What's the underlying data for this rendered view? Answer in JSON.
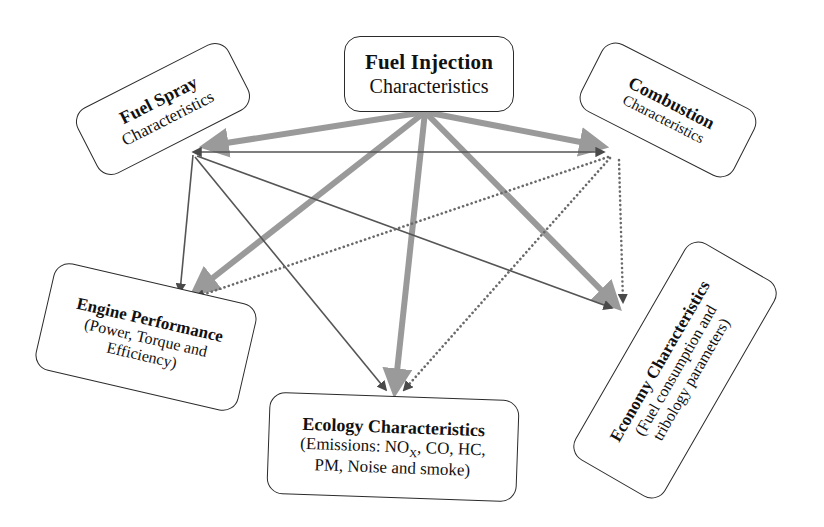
{
  "diagram": {
    "colors": {
      "thick_arrow": "#9a9a9a",
      "thin_arrow": "#555555",
      "dotted_arrow": "#6a6a6a",
      "node_border": "#2b2b2b",
      "background": "#ffffff"
    }
  },
  "nodes": {
    "injection": {
      "title": "Fuel Injection",
      "subtitle": "Characteristics"
    },
    "spray": {
      "title": "Fuel Spray",
      "subtitle": "Characteristics"
    },
    "combustion": {
      "title": "Combustion",
      "subtitle": "Characteristics"
    },
    "engine": {
      "title": "Engine Performance",
      "line2": "(Power, Torque and",
      "line3": "Efficiency)"
    },
    "ecology": {
      "title": "Ecology  Characteristics",
      "line2_pre": "(Emissions: NO",
      "line2_sub": "X",
      "line2_post": ", CO, HC,",
      "line3": "PM, Noise and smoke)"
    },
    "economy": {
      "title": "Economy  Characteristics",
      "line2": "(Fuel consumption and",
      "line3": "tribology parameters)"
    }
  },
  "edges": [
    {
      "id": "inj-spray",
      "from": "injection",
      "to": "spray",
      "style": "thick-gray",
      "arrow": "single"
    },
    {
      "id": "inj-combustion",
      "from": "injection",
      "to": "combustion",
      "style": "thick-gray",
      "arrow": "single"
    },
    {
      "id": "inj-engine",
      "from": "injection",
      "to": "engine",
      "style": "thick-gray",
      "arrow": "single"
    },
    {
      "id": "inj-ecology",
      "from": "injection",
      "to": "ecology",
      "style": "thick-gray",
      "arrow": "single"
    },
    {
      "id": "inj-economy",
      "from": "injection",
      "to": "economy",
      "style": "thick-gray",
      "arrow": "single"
    },
    {
      "id": "spray-combustion",
      "from": "spray",
      "to": "combustion",
      "style": "thin-dark",
      "arrow": "double"
    },
    {
      "id": "spray-engine",
      "from": "spray",
      "to": "engine",
      "style": "thin-dark",
      "arrow": "single"
    },
    {
      "id": "spray-ecology",
      "from": "spray",
      "to": "ecology",
      "style": "thin-dark",
      "arrow": "single"
    },
    {
      "id": "spray-economy",
      "from": "spray",
      "to": "economy",
      "style": "thin-dark",
      "arrow": "single"
    },
    {
      "id": "comb-engine",
      "from": "combustion",
      "to": "engine",
      "style": "dotted-gray",
      "arrow": "single"
    },
    {
      "id": "comb-ecology",
      "from": "combustion",
      "to": "ecology",
      "style": "dotted-gray",
      "arrow": "single"
    },
    {
      "id": "comb-economy",
      "from": "combustion",
      "to": "economy",
      "style": "dotted-gray",
      "arrow": "single"
    }
  ]
}
